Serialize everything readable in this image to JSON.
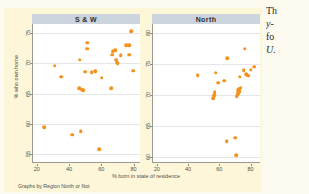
{
  "figure": {
    "xtitle": "% born in state of residence",
    "ytitle": "% who own home",
    "note": "Graphs by Region North or Not"
  },
  "side_text": {
    "line1": "Th",
    "line2": "y-",
    "line3": "fo",
    "line4": "U."
  },
  "colors": {
    "marker": "#f5921e",
    "panel_title_bg": "#ccd4dd",
    "graph_bg": "#fdf6d8",
    "plot_bg": "#ffffff",
    "grid": "#e6e6ea",
    "axis": "#9a9a90"
  },
  "chart_data": {
    "type": "scatter",
    "title": "",
    "xlabel": "% born in state of residence",
    "ylabel": "% who own home",
    "grid": true,
    "legend": "none",
    "panels": [
      {
        "label": "S & W",
        "xlim": [
          17,
          84
        ],
        "ylim": [
          53.5,
          76.5
        ],
        "xticks": [
          20,
          40,
          60,
          80
        ],
        "yticks": [
          55,
          60,
          65,
          70,
          75
        ],
        "points": [
          [
            24.0,
            59.4
          ],
          [
            30.5,
            69.6
          ],
          [
            34.5,
            67.8
          ],
          [
            41.5,
            58.2
          ],
          [
            45.5,
            65.9
          ],
          [
            46.5,
            65.8
          ],
          [
            47.5,
            65.6
          ],
          [
            48.0,
            65.5
          ],
          [
            46.5,
            58.8
          ],
          [
            46.0,
            70.6
          ],
          [
            49.5,
            68.6
          ],
          [
            50.5,
            72.4
          ],
          [
            50.5,
            73.4
          ],
          [
            53.5,
            68.5
          ],
          [
            55.5,
            68.7
          ],
          [
            58.0,
            55.8
          ],
          [
            59.5,
            67.6
          ],
          [
            65.5,
            65.9
          ],
          [
            66.0,
            71.4
          ],
          [
            66.5,
            72.0
          ],
          [
            68.0,
            72.2
          ],
          [
            68.5,
            70.6
          ],
          [
            69.0,
            70.2
          ],
          [
            69.5,
            70.0
          ],
          [
            71.5,
            71.3
          ],
          [
            75.0,
            73.0
          ],
          [
            76.5,
            73.0
          ],
          [
            76.5,
            71.4
          ],
          [
            78.0,
            75.3
          ],
          [
            79.0,
            68.8
          ]
        ]
      },
      {
        "label": "North",
        "xlim": [
          17,
          86
        ],
        "ylim": [
          59.0,
          81.5
        ],
        "xticks": [
          20,
          40,
          60,
          80
        ],
        "yticks": [
          60,
          65,
          70,
          75,
          80
        ],
        "points": [
          [
            45.5,
            73.2
          ],
          [
            55.5,
            69.5
          ],
          [
            56.0,
            70.0
          ],
          [
            56.5,
            70.5
          ],
          [
            57.0,
            73.6
          ],
          [
            58.5,
            72.0
          ],
          [
            62.5,
            72.3
          ],
          [
            64.0,
            62.5
          ],
          [
            64.5,
            76.0
          ],
          [
            69.5,
            63.1
          ],
          [
            70.0,
            60.3
          ],
          [
            70.5,
            69.8
          ],
          [
            71.0,
            70.1
          ],
          [
            71.5,
            70.3
          ],
          [
            71.5,
            70.8
          ],
          [
            72.0,
            71.0
          ],
          [
            72.5,
            70.6
          ],
          [
            72.5,
            73.0
          ],
          [
            73.0,
            71.2
          ],
          [
            75.0,
            74.0
          ],
          [
            75.5,
            77.5
          ],
          [
            76.5,
            73.4
          ],
          [
            78.0,
            73.1
          ],
          [
            79.5,
            74.1
          ],
          [
            81.5,
            74.6
          ]
        ]
      }
    ]
  }
}
